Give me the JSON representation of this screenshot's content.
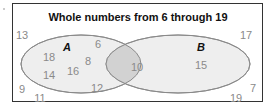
{
  "diagram": {
    "title": "Whole numbers from 6 through 19",
    "type": "venn",
    "colors": {
      "border": "#333333",
      "ellipse_fill": "#eeeeee",
      "ellipse_stroke": "#8a8a8a",
      "intersection_fill": "#d2d2d2",
      "number_text": "#8a8a8a",
      "label_text": "#111111"
    },
    "sets": {
      "A": {
        "label": "A"
      },
      "B": {
        "label": "B"
      }
    },
    "regions": {
      "a_only": [
        "18",
        "14",
        "16",
        "8",
        "6",
        "12"
      ],
      "both": [
        "10"
      ],
      "b_only": [
        "15"
      ],
      "outside": [
        "13",
        "9",
        "11",
        "17",
        "7",
        "19"
      ]
    },
    "labels": {
      "n13": "13",
      "n17": "17",
      "n9": "9",
      "n11": "11",
      "n7": "7",
      "n19": "19",
      "n18": "18",
      "n14": "14",
      "n16": "16",
      "n8": "8",
      "n6": "6",
      "n12": "12",
      "n10": "10",
      "n15": "15",
      "setA": "A",
      "setB": "B"
    }
  }
}
